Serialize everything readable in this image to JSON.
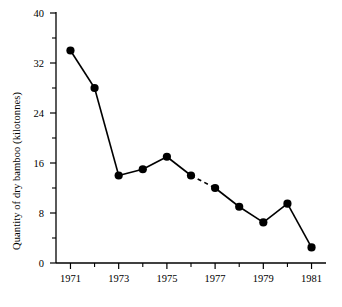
{
  "chart_data": {
    "type": "line",
    "title": "",
    "xlabel": "",
    "ylabel": "Quantity of dry bamboo (kilotonnes)",
    "x": [
      1971,
      1972,
      1973,
      1974,
      1975,
      1976,
      1977,
      1978,
      1979,
      1980,
      1981
    ],
    "values": [
      34,
      28,
      14,
      15,
      17,
      14,
      12,
      9,
      6.5,
      9.5,
      2.5
    ],
    "series": [
      {
        "name": "Quantity of dry bamboo",
        "values": [
          34,
          28,
          14,
          15,
          17,
          14,
          12,
          9,
          6.5,
          9.5,
          2.5
        ]
      }
    ],
    "xlim": [
      1970.4,
      1981.6
    ],
    "ylim": [
      0,
      40
    ],
    "ytick_values": [
      0,
      8,
      16,
      24,
      32,
      40
    ],
    "ytick_labels": [
      "0",
      "8",
      "16",
      "24",
      "32",
      "40"
    ],
    "yminor_ticks": [
      4,
      12,
      20,
      28,
      36
    ],
    "xtick_values": [
      1971,
      1973,
      1975,
      1977,
      1979,
      1981
    ],
    "xtick_labels": [
      "1971",
      "1973",
      "1975",
      "1977",
      "1979",
      "1981"
    ],
    "xminor_ticks": [
      1972,
      1974,
      1976,
      1978,
      1980
    ],
    "grid": false,
    "legend": "none",
    "marker": "filled-circle",
    "line_color": "#000000",
    "marker_color": "#000000",
    "dashed_segments": [
      [
        1976,
        1977
      ]
    ],
    "annotations": []
  }
}
